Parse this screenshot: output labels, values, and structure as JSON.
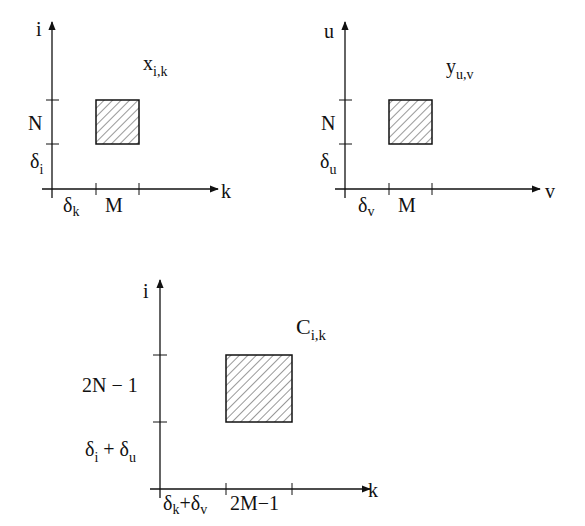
{
  "diagrams": [
    {
      "name": "x",
      "title": "x",
      "title_sub": "i,k",
      "y_axis_label": "i",
      "x_axis_label": "k",
      "y_labels": [
        {
          "main": "N",
          "sub": ""
        },
        {
          "main": "δ",
          "sub": "i"
        }
      ],
      "x_labels": [
        {
          "main": "δ",
          "sub": "k"
        },
        {
          "main": "M",
          "sub": ""
        }
      ]
    },
    {
      "name": "y",
      "title": "y",
      "title_sub": "u,v",
      "y_axis_label": "u",
      "x_axis_label": "v",
      "y_labels": [
        {
          "main": "N",
          "sub": ""
        },
        {
          "main": "δ",
          "sub": "u"
        }
      ],
      "x_labels": [
        {
          "main": "δ",
          "sub": "v"
        },
        {
          "main": "M",
          "sub": ""
        }
      ]
    },
    {
      "name": "c",
      "title": "C",
      "title_sub": "i,k",
      "y_axis_label": "i",
      "x_axis_label": "k",
      "y_labels": [
        {
          "main": "2N − 1",
          "sub": ""
        },
        {
          "parts": [
            "δ",
            "i",
            " + δ",
            "u"
          ]
        }
      ],
      "x_labels": [
        {
          "parts": [
            "δ",
            "k",
            "+δ",
            "v"
          ]
        },
        {
          "main": "2M−1",
          "sub": ""
        }
      ]
    }
  ]
}
